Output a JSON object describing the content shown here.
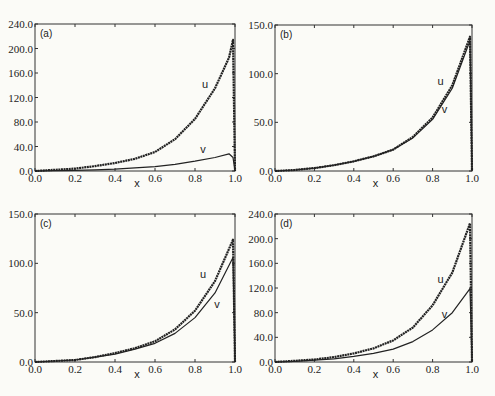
{
  "chart_data": [
    {
      "type": "line",
      "panel_label": "(a)",
      "xlabel": "x",
      "ylabel": "",
      "xlim": [
        0.0,
        1.0
      ],
      "ylim": [
        0.0,
        240.0
      ],
      "x_ticks": [
        "0.0",
        "0.2",
        "0.4",
        "0.6",
        "0.8",
        "1.0"
      ],
      "y_ticks": [
        "0.0",
        "40.0",
        "80.0",
        "120.0",
        "160.0",
        "200.0",
        "240.0"
      ],
      "x": [
        0.0,
        0.1,
        0.2,
        0.3,
        0.4,
        0.5,
        0.6,
        0.7,
        0.8,
        0.9,
        0.97,
        0.99,
        1.0
      ],
      "series": [
        {
          "name": "u",
          "values": [
            0,
            2,
            4,
            8,
            13,
            20,
            31,
            52,
            85,
            135,
            185,
            214,
            0
          ]
        },
        {
          "name": "v",
          "values": [
            0,
            0.5,
            1,
            2,
            3,
            5,
            7,
            11,
            16,
            22,
            28,
            22,
            0
          ]
        }
      ],
      "annotations": [
        {
          "text": "u",
          "x": 0.85,
          "y": 135
        },
        {
          "text": "v",
          "x": 0.84,
          "y": 30
        }
      ]
    },
    {
      "type": "line",
      "panel_label": "(b)",
      "xlabel": "x",
      "ylabel": "",
      "xlim": [
        0.0,
        1.0
      ],
      "ylim": [
        0.0,
        150.0
      ],
      "x_ticks": [
        "0.0",
        "0.2",
        "0.4",
        "0.6",
        "0.8",
        "1.0"
      ],
      "y_ticks": [
        "0.0",
        "50.0",
        "100.0",
        "150.0"
      ],
      "x": [
        0.0,
        0.1,
        0.2,
        0.3,
        0.4,
        0.5,
        0.6,
        0.7,
        0.8,
        0.9,
        0.99,
        1.0
      ],
      "series": [
        {
          "name": "u",
          "values": [
            0,
            1,
            3,
            6,
            10,
            15,
            22,
            35,
            55,
            88,
            138,
            0
          ]
        },
        {
          "name": "v",
          "values": [
            0,
            1,
            3,
            6,
            10,
            15,
            22,
            34,
            53,
            85,
            134,
            0
          ]
        }
      ],
      "annotations": [
        {
          "text": "u",
          "x": 0.84,
          "y": 88
        },
        {
          "text": "v",
          "x": 0.86,
          "y": 60
        }
      ]
    },
    {
      "type": "line",
      "panel_label": "(c)",
      "xlabel": "x",
      "ylabel": "",
      "xlim": [
        0.0,
        1.0
      ],
      "ylim": [
        0.0,
        150.0
      ],
      "x_ticks": [
        "0.0",
        "0.2",
        "0.4",
        "0.6",
        "0.8",
        "1.0"
      ],
      "y_ticks": [
        "0.0",
        "50.0",
        "100.0",
        "150.0"
      ],
      "x": [
        0.0,
        0.1,
        0.2,
        0.3,
        0.4,
        0.5,
        0.6,
        0.7,
        0.8,
        0.9,
        0.99,
        1.0
      ],
      "series": [
        {
          "name": "u",
          "values": [
            0,
            1,
            2,
            5,
            9,
            14,
            21,
            33,
            52,
            82,
            124,
            0
          ]
        },
        {
          "name": "v",
          "values": [
            0,
            1,
            2,
            5,
            8,
            13,
            19,
            29,
            45,
            70,
            106,
            0
          ]
        }
      ],
      "annotations": [
        {
          "text": "u",
          "x": 0.84,
          "y": 85
        },
        {
          "text": "v",
          "x": 0.91,
          "y": 55
        }
      ]
    },
    {
      "type": "line",
      "panel_label": "(d)",
      "xlabel": "x",
      "ylabel": "",
      "xlim": [
        0.0,
        1.0
      ],
      "ylim": [
        0.0,
        240.0
      ],
      "x_ticks": [
        "0.0",
        "0.2",
        "0.4",
        "0.6",
        "0.8",
        "1.0"
      ],
      "y_ticks": [
        "0.0",
        "40.0",
        "80.0",
        "120.0",
        "160.0",
        "200.0",
        "240.0"
      ],
      "x": [
        0.0,
        0.1,
        0.2,
        0.3,
        0.4,
        0.5,
        0.6,
        0.7,
        0.8,
        0.9,
        0.99,
        1.0
      ],
      "series": [
        {
          "name": "u",
          "values": [
            0,
            2,
            4,
            8,
            14,
            22,
            35,
            56,
            92,
            145,
            225,
            0
          ]
        },
        {
          "name": "v",
          "values": [
            0,
            1,
            3,
            5,
            9,
            14,
            21,
            33,
            52,
            80,
            119,
            0
          ]
        }
      ],
      "annotations": [
        {
          "text": "u",
          "x": 0.84,
          "y": 128
        },
        {
          "text": "v",
          "x": 0.86,
          "y": 72
        }
      ]
    }
  ],
  "panels": [
    {
      "label": "(a)",
      "box": {
        "x0": 35,
        "y0": 24,
        "x1": 235,
        "y1": 171
      }
    },
    {
      "label": "(b)",
      "box": {
        "x0": 275,
        "y0": 25,
        "x1": 472,
        "y1": 171
      }
    },
    {
      "label": "(c)",
      "box": {
        "x0": 35,
        "y0": 214,
        "x1": 235,
        "y1": 362
      }
    },
    {
      "label": "(d)",
      "box": {
        "x0": 275,
        "y0": 214,
        "x1": 472,
        "y1": 362
      }
    }
  ],
  "colors": {
    "line": "#222222",
    "background": "#fbfbf7",
    "axis": "#333333"
  }
}
